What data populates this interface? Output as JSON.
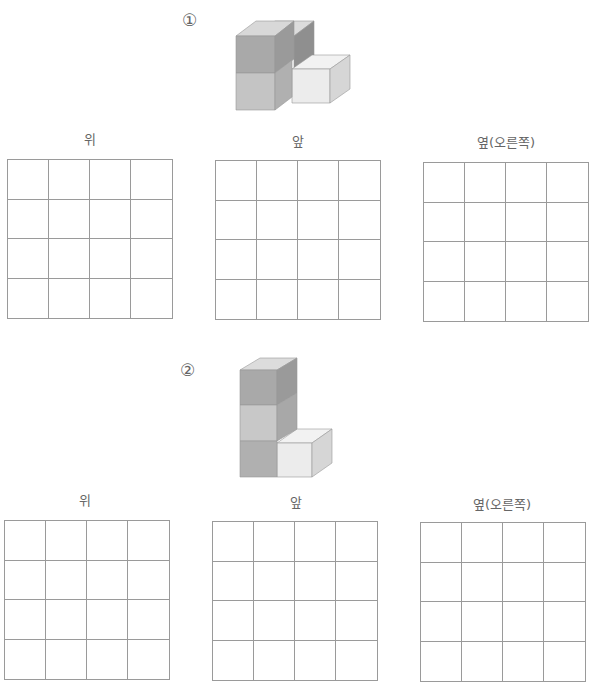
{
  "problems": [
    {
      "number": "①",
      "views": [
        {
          "label": "위",
          "rows": 4,
          "cols": 4
        },
        {
          "label": "앞",
          "rows": 4,
          "cols": 4
        },
        {
          "label": "옆(오른쪽)",
          "rows": 4,
          "cols": 4
        }
      ],
      "figure": {
        "description": "two stacked cubes in front-left, one cube behind at top level, one light cube to the right on bottom level"
      }
    },
    {
      "number": "②",
      "views": [
        {
          "label": "위",
          "rows": 4,
          "cols": 4
        },
        {
          "label": "앞",
          "rows": 4,
          "cols": 4
        },
        {
          "label": "옆(오른쪽)",
          "rows": 4,
          "cols": 4
        }
      ],
      "figure": {
        "description": "column of three stacked cubes with one light cube to the right on bottom level"
      }
    }
  ],
  "colors": {
    "cube_dark": "#a9a9a9",
    "cube_mid": "#c4c4c4",
    "cube_light": "#ececec",
    "cube_side_dark": "#8f8f8f",
    "cube_top": "#dcdcdc",
    "grid_line": "#9a9a9a"
  }
}
